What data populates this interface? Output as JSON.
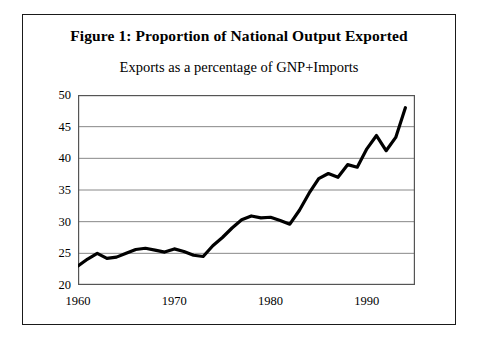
{
  "figure": {
    "title": "Figure 1: Proportion of National Output Exported",
    "subtitle": "Exports as a percentage of GNP+Imports"
  },
  "chart_data": {
    "type": "line",
    "title": "Figure 1: Proportion of National Output Exported",
    "subtitle": "Exports as a percentage of GNP+Imports",
    "xlabel": "",
    "ylabel": "",
    "xlim": [
      1960,
      1995
    ],
    "ylim": [
      20,
      50
    ],
    "grid": true,
    "legend": "none",
    "line_color": "#000000",
    "line_width": 3.2,
    "xticks": [
      1960,
      1970,
      1980,
      1990
    ],
    "yticks": [
      20,
      25,
      30,
      35,
      40,
      45,
      50
    ],
    "x": [
      1960,
      1961,
      1962,
      1963,
      1964,
      1965,
      1966,
      1967,
      1968,
      1969,
      1970,
      1971,
      1972,
      1973,
      1974,
      1975,
      1976,
      1977,
      1978,
      1979,
      1980,
      1981,
      1982,
      1983,
      1984,
      1985,
      1986,
      1987,
      1988,
      1989,
      1990,
      1991,
      1992,
      1993,
      1994
    ],
    "values": [
      23.0,
      24.1,
      25.0,
      24.2,
      24.4,
      25.0,
      25.6,
      25.8,
      25.5,
      25.2,
      25.7,
      25.3,
      24.7,
      24.5,
      26.2,
      27.5,
      29.0,
      30.3,
      30.9,
      30.6,
      30.7,
      30.2,
      29.6,
      31.8,
      34.5,
      36.8,
      37.6,
      37.0,
      39.0,
      38.6,
      41.5,
      43.6,
      41.2,
      43.3,
      48.0
    ]
  }
}
